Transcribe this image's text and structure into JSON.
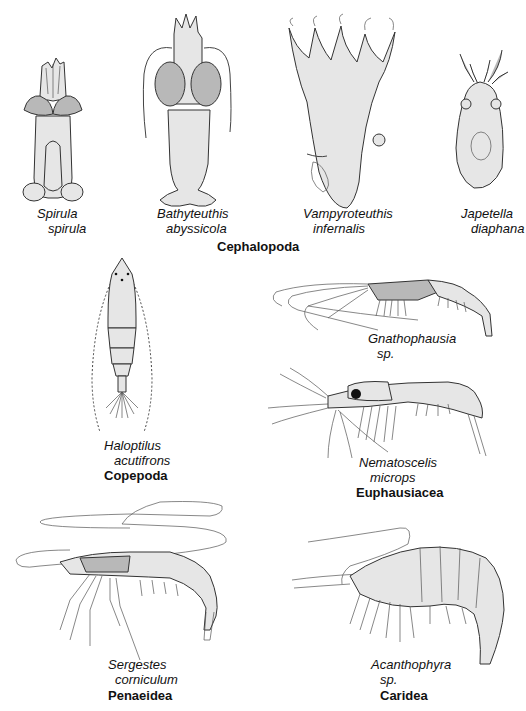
{
  "figure": {
    "groups": [
      {
        "group_label": "Cephalopoda",
        "specimens": [
          {
            "genus": "Spirula",
            "species": "spirula"
          },
          {
            "genus": "Bathyteuthis",
            "species": "abyssicola"
          },
          {
            "genus": "Vampyroteuthis",
            "species": "infernalis"
          },
          {
            "genus": "Japetella",
            "species": "diaphana"
          }
        ]
      },
      {
        "group_label": "Copepoda",
        "specimens": [
          {
            "genus": "Haloptilus",
            "species": "acutifrons"
          }
        ]
      },
      {
        "group_label": "Euphausiacea",
        "specimens": [
          {
            "genus": "Gnathophausia",
            "species": "sp."
          },
          {
            "genus": "Nematoscelis",
            "species": "microps"
          }
        ]
      },
      {
        "group_label": "Penaeidea",
        "specimens": [
          {
            "genus": "Sergestes",
            "species": "corniculum"
          }
        ]
      },
      {
        "group_label": "Caridea",
        "specimens": [
          {
            "genus": "Acanthophyra",
            "species": "sp."
          }
        ]
      }
    ]
  }
}
